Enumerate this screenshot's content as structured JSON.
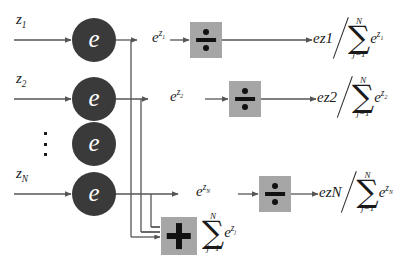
{
  "figure": {
    "colors": {
      "background": "#ffffff",
      "node_fill": "#3a3a3a",
      "node_text": "#ffffff",
      "operator_box_fill": "#a6a6a6",
      "operator_glyph": "#111111",
      "line": "#555555",
      "text": "#1a1a1a"
    }
  },
  "inputs": [
    {
      "name": "input-z1",
      "base": "z",
      "sub": "1"
    },
    {
      "name": "input-z2",
      "base": "z",
      "sub": "2"
    },
    {
      "name": "input-zN",
      "base": "z",
      "sub": "N"
    }
  ],
  "nodes": [
    {
      "name": "exp-node-1",
      "label": "e"
    },
    {
      "name": "exp-node-2",
      "label": "e"
    },
    {
      "name": "exp-node-3",
      "label": "e"
    },
    {
      "name": "exp-node-N",
      "label": "e"
    }
  ],
  "ellipsis": {
    "glyph": "vertical-ellipsis",
    "dots": 3
  },
  "exp_outputs": [
    {
      "name": "exp-output-1",
      "base": "e",
      "sup_base": "z",
      "sup_sub": "1"
    },
    {
      "name": "exp-output-2",
      "base": "e",
      "sup_base": "z",
      "sup_sub": "2"
    },
    {
      "name": "exp-output-N",
      "base": "e",
      "sup_base": "z",
      "sup_sub": "N"
    }
  ],
  "operators": {
    "divide": {
      "glyph": "division-sign",
      "symbol": "÷",
      "count": 3
    },
    "sum": {
      "glyph": "plus-sign",
      "symbol": "+",
      "count": 1
    }
  },
  "sum_expression": {
    "name": "sum-of-exponentials",
    "sigma": "∑",
    "upper_limit": "N",
    "lower_limit": "j=1",
    "term_base": "e",
    "term_sup_base": "z",
    "term_sup_sub": "j"
  },
  "results": [
    {
      "name": "softmax-output-1",
      "numerator_base": "e",
      "numerator_sup_base": "z",
      "numerator_sup_sub": "1",
      "sigma": "∑",
      "upper_limit": "N",
      "lower_limit": "j=1",
      "denominator_base": "e",
      "denominator_sup_base": "z",
      "denominator_sup_sub": "1"
    },
    {
      "name": "softmax-output-2",
      "numerator_base": "e",
      "numerator_sup_base": "z",
      "numerator_sup_sub": "2",
      "sigma": "∑",
      "upper_limit": "N",
      "lower_limit": "j=1",
      "denominator_base": "e",
      "denominator_sup_base": "z",
      "denominator_sup_sub": "2"
    },
    {
      "name": "softmax-output-N",
      "numerator_base": "e",
      "numerator_sup_base": "z",
      "numerator_sup_sub": "N",
      "sigma": "∑",
      "upper_limit": "N",
      "lower_limit": "j=1",
      "denominator_base": "e",
      "denominator_sup_base": "z",
      "denominator_sup_sub": "N"
    }
  ]
}
